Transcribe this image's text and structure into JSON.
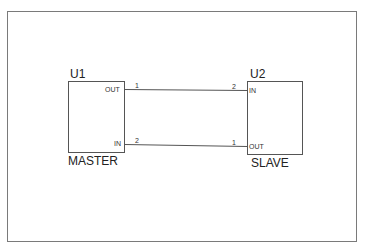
{
  "diagram": {
    "type": "schematic",
    "components": [
      {
        "ref": "U1",
        "name": "MASTER",
        "pins": [
          {
            "label": "OUT",
            "number": "1",
            "side": "right"
          },
          {
            "label": "IN",
            "number": "2",
            "side": "right"
          }
        ]
      },
      {
        "ref": "U2",
        "name": "SLAVE",
        "pins": [
          {
            "label": "IN",
            "number": "2",
            "side": "left"
          },
          {
            "label": "OUT",
            "number": "1",
            "side": "left"
          }
        ]
      }
    ],
    "wires": [
      {
        "from": "U1.OUT (pin 1)",
        "to": "U2.IN (pin 2)"
      },
      {
        "from": "U2.OUT (pin 1)",
        "to": "U1.IN (pin 2)"
      }
    ],
    "colors": {
      "line": "#555555",
      "frame": "#7a7a7a",
      "text": "#222222"
    }
  }
}
